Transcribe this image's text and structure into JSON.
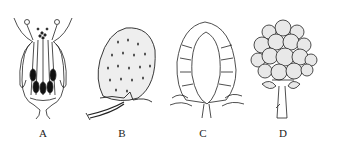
{
  "figure": {
    "panels": [
      {
        "label": "A",
        "subject": "flower-longitudinal-section"
      },
      {
        "label": "B",
        "subject": "strawberry-fruit"
      },
      {
        "label": "C",
        "subject": "strawberry-fruit-section"
      },
      {
        "label": "D",
        "subject": "raspberry-aggregate-fruit"
      }
    ]
  }
}
